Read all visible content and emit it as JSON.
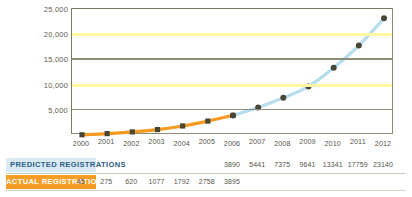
{
  "chart_data": {
    "type": "line",
    "title": "",
    "xlabel": "",
    "ylabel": "",
    "x": [
      2000,
      2001,
      2002,
      2003,
      2004,
      2005,
      2006,
      2007,
      2008,
      2009,
      2010,
      2011,
      2012
    ],
    "tick_labels": [
      "2000",
      "2001",
      "2002",
      "2003",
      "2004",
      "2005",
      "2006",
      "2007",
      "2008",
      "2009",
      "2010",
      "2011",
      "2012"
    ],
    "ylim": [
      0,
      25000
    ],
    "yticks": [
      5000,
      10000,
      15000,
      20000,
      25000
    ],
    "ytick_labels": [
      "5,000",
      "10,000",
      "15,000",
      "20,000",
      "25,000"
    ],
    "grid": true,
    "legend_position": "bottom-table",
    "series": [
      {
        "name": "Actual Registrations",
        "color": "#f59a20",
        "marker": "square",
        "marker_color": "#4a4636",
        "values": [
          45,
          275,
          620,
          1077,
          1792,
          2758,
          3895,
          null,
          null,
          null,
          null,
          null,
          null
        ]
      },
      {
        "name": "Predicted Registrations",
        "color": "#b6ddf0",
        "marker": "circle",
        "marker_color": "#4a4636",
        "values": [
          null,
          null,
          null,
          null,
          null,
          null,
          3890,
          5441,
          7375,
          9641,
          13341,
          17759,
          23140
        ]
      }
    ]
  },
  "axis": {
    "yticks": [
      {
        "label": "25,000",
        "value": 25000,
        "gridline": "gray"
      },
      {
        "label": "20,000",
        "value": 20000,
        "gridline": "yellow"
      },
      {
        "label": "15,000",
        "value": 15000,
        "gridline": "gray"
      },
      {
        "label": "10,000",
        "value": 10000,
        "gridline": "yellow"
      },
      {
        "label": "5,000",
        "value": 5000,
        "gridline": "gray"
      }
    ],
    "xticks": [
      "2000",
      "2001",
      "2002",
      "2003",
      "2004",
      "2005",
      "2006",
      "2007",
      "2008",
      "2009",
      "2010",
      "2011",
      "2012"
    ]
  },
  "legend_table": {
    "rows": [
      {
        "label": "Predicted Registrations",
        "label_bg": "#d9eaf4",
        "label_color": "#2c5f86",
        "values": [
          "",
          "",
          "",
          "",
          "",
          "",
          "3890",
          "5441",
          "7375",
          "9641",
          "13341",
          "17759",
          "23140"
        ]
      },
      {
        "label": "Actual Registrations",
        "label_bg": "#f79d25",
        "label_color": "#ffffff",
        "values": [
          "45",
          "275",
          "620",
          "1077",
          "1792",
          "2758",
          "3895",
          "",
          "",
          "",
          "",
          "",
          ""
        ]
      }
    ]
  },
  "colors": {
    "actual_line": "#f59a20",
    "predicted_line": "#b6ddf0",
    "marker": "#4a4636",
    "gridline_yellow": "#fdf7a6",
    "gridline_gray": "#8d8d76",
    "frame": "#7a7a63",
    "background": "#ffffff"
  }
}
